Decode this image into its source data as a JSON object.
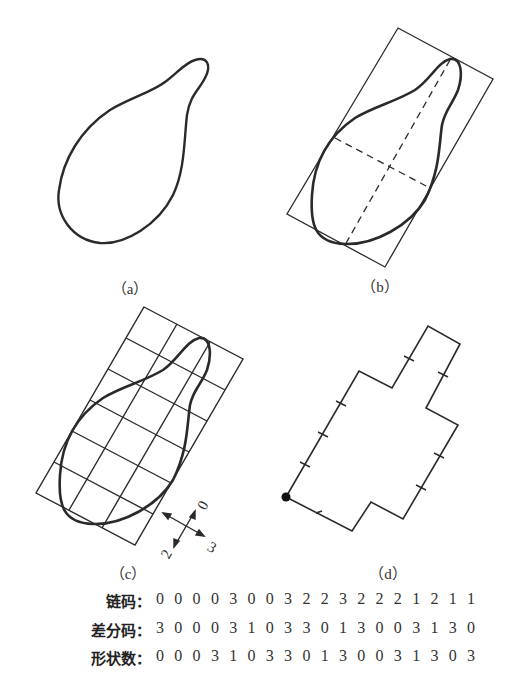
{
  "figure": {
    "panels": [
      {
        "id": "a",
        "caption": "（a）",
        "description": "pear-shaped closed contour"
      },
      {
        "id": "b",
        "caption": "（b）",
        "description": "contour with major/minor axes (dashed) and bounding rectangle"
      },
      {
        "id": "c",
        "caption": "（c）",
        "description": "contour overlaid on 3x6 grid aligned to bounding rectangle, with direction axes"
      },
      {
        "id": "d",
        "caption": "（d）",
        "description": "4-directional chain-code polygon approximation with start point"
      }
    ],
    "direction_labels": {
      "up": "0",
      "left": "2",
      "right": "3"
    },
    "colors": {
      "line": "#2a2a2a",
      "background": "#ffffff"
    }
  },
  "codes": [
    {
      "label": "链码：",
      "digits": [
        "0",
        "0",
        "0",
        "0",
        "3",
        "0",
        "0",
        "3",
        "2",
        "2",
        "3",
        "2",
        "2",
        "2",
        "1",
        "2",
        "1",
        "1"
      ]
    },
    {
      "label": "差分码：",
      "digits": [
        "3",
        "0",
        "0",
        "0",
        "3",
        "1",
        "0",
        "3",
        "3",
        "0",
        "1",
        "3",
        "0",
        "0",
        "3",
        "1",
        "3",
        "0"
      ]
    },
    {
      "label": "形状数：",
      "digits": [
        "0",
        "0",
        "0",
        "3",
        "1",
        "0",
        "3",
        "3",
        "0",
        "1",
        "3",
        "0",
        "0",
        "3",
        "1",
        "3",
        "0",
        "3"
      ]
    }
  ]
}
